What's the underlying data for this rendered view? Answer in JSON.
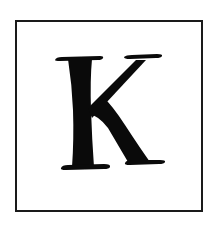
{
  "tile": {
    "letter": "K",
    "border_color": "#1a1a1a",
    "letter_color": "#0a0a0a",
    "background": "#ffffff"
  }
}
